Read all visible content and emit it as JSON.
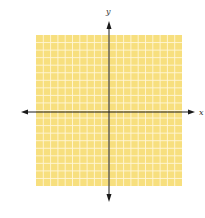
{
  "diagram": {
    "type": "coordinate-plane",
    "grid": {
      "left": 36,
      "top": 35,
      "right": 182,
      "bottom": 186,
      "cells_x": 20,
      "cells_y": 20,
      "fill_color": "#F7DF7E",
      "line_color": "#FFF6D8"
    },
    "axes": {
      "origin_x": 109,
      "origin_y": 112,
      "x_start": 21,
      "x_end": 195,
      "y_start": 21,
      "y_end": 202,
      "color": "#1a1a1a"
    },
    "labels": {
      "x_axis": "x",
      "y_axis": "y"
    }
  }
}
